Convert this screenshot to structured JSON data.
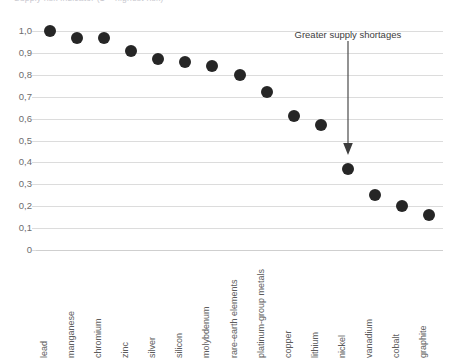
{
  "caption": {
    "text": "Supply risk indicator (1 = highest risk)"
  },
  "annotation": {
    "label": "Greater supply shortages",
    "arrow_icon": "down-arrow-icon"
  },
  "chart_data": {
    "type": "scatter",
    "title": "",
    "subtitle": "",
    "xlabel": "",
    "ylabel": "",
    "ylim": [
      0,
      1.0
    ],
    "grid": true,
    "legend_position": "none",
    "marker_color": "#262626",
    "gridline_color": "#dcdcdc",
    "ytick_labels": [
      "1,0",
      "0,9",
      "0,8",
      "0,7",
      "0,6",
      "0,5",
      "0,4",
      "0,3",
      "0,2",
      "0,1",
      "0"
    ],
    "ytick_values": [
      1.0,
      0.9,
      0.8,
      0.7,
      0.6,
      0.5,
      0.4,
      0.3,
      0.2,
      0.1,
      0
    ],
    "categories": [
      "lead",
      "manganese",
      "chromium",
      "zinc",
      "silver",
      "silicon",
      "molybdenum",
      "rare-earth elements",
      "platinum-group metals",
      "copper",
      "lithium",
      "nickel",
      "vanadium",
      "cobalt",
      "graphite"
    ],
    "values": [
      1.0,
      0.97,
      0.97,
      0.91,
      0.87,
      0.86,
      0.84,
      0.8,
      0.72,
      0.61,
      0.57,
      0.37,
      0.25,
      0.2,
      0.16
    ]
  }
}
